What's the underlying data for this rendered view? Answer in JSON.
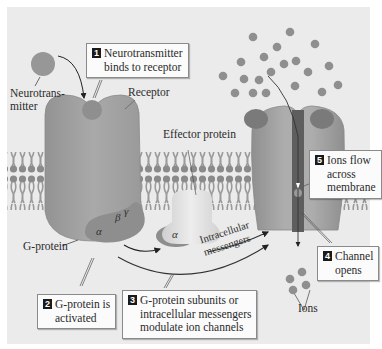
{
  "figure": {
    "title_fragment": "",
    "background_color": "#ebebeb",
    "colors": {
      "protein": "#9e9e9e",
      "protein_dark": "#7e7e7e",
      "membrane_head": "#8c8c8c",
      "membrane_tail": "#a8a8a8",
      "ion": "#8f8f8f",
      "effector": "#d6d6d6",
      "channel_pore": "#5a5a5a",
      "callout_bg": "#fbfbfb",
      "callout_badge": "#1a1a1a"
    }
  },
  "labels": {
    "neurotransmitter": [
      "Neurotrans-",
      "mitter"
    ],
    "receptor": "Receptor",
    "effector_protein": "Effector protein",
    "g_protein": "G-protein",
    "intracellular_messengers": [
      "Intracellular",
      "messengers"
    ],
    "ions": "Ions",
    "alpha": "α",
    "beta": "β",
    "gamma": "γ",
    "alpha_free": "α"
  },
  "callouts": [
    {
      "step": "1",
      "lines": [
        "Neurotransmitter",
        "binds to receptor"
      ]
    },
    {
      "step": "2",
      "lines": [
        "G-protein is",
        "activated"
      ]
    },
    {
      "step": "3",
      "lines": [
        "G-protein subunits or",
        "intracellular messengers",
        "modulate ion channels"
      ]
    },
    {
      "step": "4",
      "lines": [
        "Channel",
        "opens"
      ]
    },
    {
      "step": "5",
      "lines": [
        "Ions flow",
        "across",
        "membrane"
      ]
    }
  ],
  "ions_extracellular": [
    [
      253,
      37
    ],
    [
      290,
      32
    ],
    [
      277,
      47
    ],
    [
      315,
      44
    ],
    [
      241,
      62
    ],
    [
      264,
      57
    ],
    [
      284,
      64
    ],
    [
      296,
      61
    ],
    [
      329,
      66
    ],
    [
      223,
      76
    ],
    [
      244,
      79
    ],
    [
      259,
      80
    ],
    [
      271,
      72
    ],
    [
      308,
      72
    ],
    [
      338,
      85
    ],
    [
      235,
      93
    ],
    [
      253,
      93
    ],
    [
      266,
      93
    ],
    [
      295,
      86
    ],
    [
      322,
      92
    ]
  ],
  "ions_intracellular": [
    [
      288,
      272
    ],
    [
      298,
      268
    ],
    [
      305,
      283
    ],
    [
      292,
      283
    ]
  ]
}
